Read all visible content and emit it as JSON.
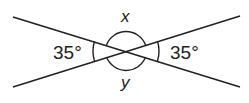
{
  "diagram": {
    "type": "intersecting-lines-angles",
    "stroke_color": "#222222",
    "background": "#ffffff",
    "intersection": {
      "x": 126,
      "y": 51
    },
    "lines": [
      {
        "name": "line-1",
        "from": {
          "x": 13,
          "y": 17
        },
        "to": {
          "x": 240,
          "y": 87
        }
      },
      {
        "name": "line-2",
        "from": {
          "x": 13,
          "y": 87
        },
        "to": {
          "x": 240,
          "y": 16
        }
      }
    ],
    "labels": {
      "left_angle": "35°",
      "right_angle": "35°",
      "top_angle": "x",
      "bottom_angle": "y"
    }
  }
}
